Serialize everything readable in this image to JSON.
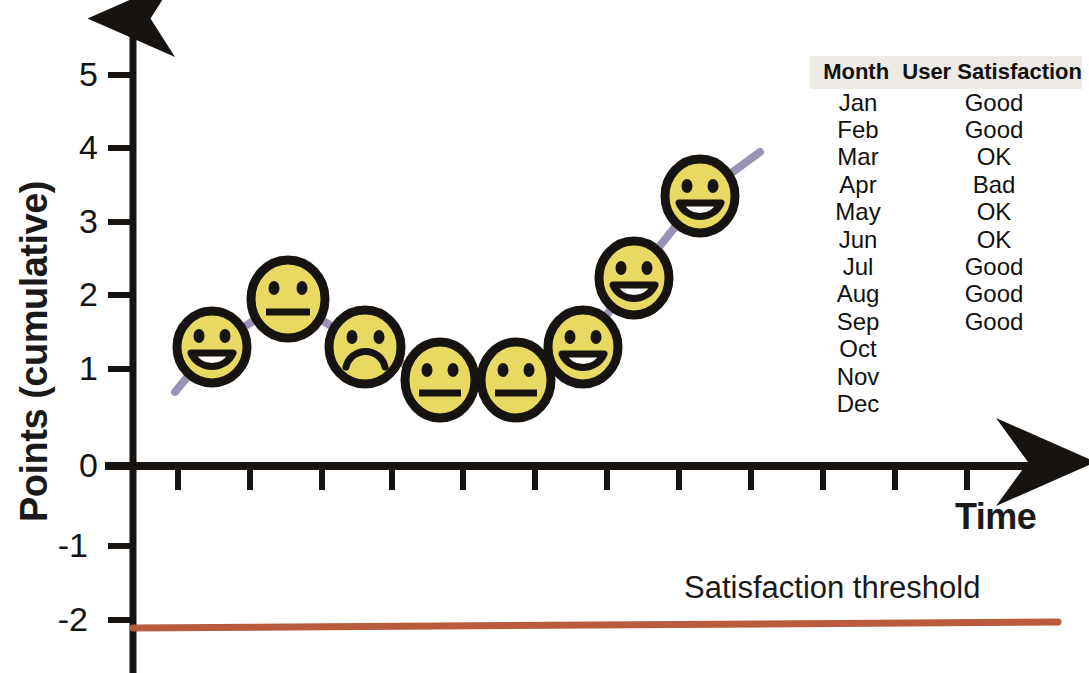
{
  "axes": {
    "y_title": "Points (cumulative)",
    "x_title": "Time",
    "y_ticks": [
      "5",
      "4",
      "3",
      "2",
      "1",
      "0",
      "-1",
      "-2"
    ]
  },
  "annotations": {
    "threshold_label": "Satisfaction threshold"
  },
  "table": {
    "headers": [
      "Month",
      "User Satisfaction"
    ],
    "rows": [
      {
        "month": "Jan",
        "satisfaction": "Good"
      },
      {
        "month": "Feb",
        "satisfaction": "Good"
      },
      {
        "month": "Mar",
        "satisfaction": "OK"
      },
      {
        "month": "Apr",
        "satisfaction": "Bad"
      },
      {
        "month": "May",
        "satisfaction": "OK"
      },
      {
        "month": "Jun",
        "satisfaction": "OK"
      },
      {
        "month": "Jul",
        "satisfaction": "Good"
      },
      {
        "month": "Aug",
        "satisfaction": "Good"
      },
      {
        "month": "Sep",
        "satisfaction": "Good"
      },
      {
        "month": "Oct",
        "satisfaction": ""
      },
      {
        "month": "Nov",
        "satisfaction": ""
      },
      {
        "month": "Dec",
        "satisfaction": ""
      }
    ]
  },
  "colors": {
    "line": "#9a93b5",
    "threshold_line": "#b95b3c",
    "face_fill": "#e8d963",
    "face_stroke": "#171310",
    "axis": "#171310",
    "text": "#141414",
    "table_header_bg": "#eeebe6"
  },
  "chart_data": {
    "type": "line",
    "title": "",
    "xlabel": "Time",
    "ylabel": "Points (cumulative)",
    "ylim": [
      -2.4,
      5.6
    ],
    "xlim": [
      0,
      13
    ],
    "grid": false,
    "legend": "none",
    "y_ticks": [
      5,
      4,
      3,
      2,
      1,
      0,
      -1,
      -2
    ],
    "x_tick_count": 12,
    "categories": [
      "Jan",
      "Feb",
      "Mar",
      "Apr",
      "May",
      "Jun",
      "Jul",
      "Aug",
      "Sep",
      "Oct",
      "Nov",
      "Dec"
    ],
    "series": [
      {
        "name": "Points (cumulative)",
        "marker": "smiley-face",
        "x": [
          1,
          2,
          3,
          4,
          5,
          6,
          7,
          8,
          9
        ],
        "values": [
          1.6,
          2.1,
          1.6,
          1.15,
          1.15,
          1.6,
          2.55,
          3.5,
          null
        ],
        "markers": [
          "happy",
          "neutral",
          "sad",
          "neutral",
          "neutral",
          "happy",
          "happy",
          "happy"
        ]
      }
    ],
    "points": [
      {
        "month": "Jan",
        "value": 1.6,
        "face": "happy",
        "satisfaction": "Good"
      },
      {
        "month": "Feb",
        "value": 2.1,
        "face": "neutral",
        "satisfaction": "Good"
      },
      {
        "month": "Mar",
        "value": 1.6,
        "face": "sad",
        "satisfaction": "OK"
      },
      {
        "month": "Apr",
        "value": 1.15,
        "face": "neutral",
        "satisfaction": "Bad"
      },
      {
        "month": "May",
        "value": 1.15,
        "face": "neutral",
        "satisfaction": "OK"
      },
      {
        "month": "Jun",
        "value": 1.6,
        "face": "happy",
        "satisfaction": "OK"
      },
      {
        "month": "Jul",
        "value": 2.55,
        "face": "happy",
        "satisfaction": "Good"
      },
      {
        "month": "Aug",
        "value": 3.5,
        "face": "happy",
        "satisfaction": "Good"
      }
    ],
    "reference_lines": [
      {
        "label": "Satisfaction threshold",
        "y": -2.0,
        "color": "#b95b3c",
        "orientation": "horizontal"
      }
    ]
  }
}
